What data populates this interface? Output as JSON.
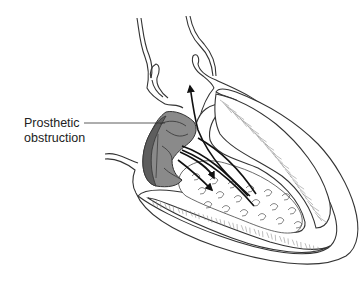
{
  "figure": {
    "type": "medical-illustration",
    "labels": [
      {
        "id": "prosthetic-obstruction",
        "line1": "Prosthetic",
        "line2": "obstruction"
      }
    ],
    "colors": {
      "line": "#333333",
      "valve_fill": "#8a8a8a",
      "valve_dark": "#5e5e5e",
      "arrow": "#111111",
      "background": "#ffffff"
    }
  }
}
